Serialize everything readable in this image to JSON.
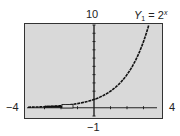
{
  "chart_data": {
    "type": "line",
    "function": "2^x",
    "series": [
      {
        "name": "Y1 = 2^x",
        "x": [
          -4,
          -3,
          -2,
          -1,
          0,
          1,
          2,
          3,
          3.32
        ],
        "values": [
          0.0625,
          0.125,
          0.25,
          0.5,
          1,
          2,
          4,
          8,
          10
        ]
      }
    ],
    "xlim": [
      -4,
      4
    ],
    "ylim": [
      -1,
      10
    ],
    "xscale": 1,
    "yscale": 1,
    "grid": false,
    "xlabel": "",
    "ylabel": "",
    "window_labels": {
      "xmin": "−4",
      "xmax": "4",
      "ymin": "−1",
      "ymax": "10"
    }
  },
  "labels": {
    "ymax": "10",
    "ymin": "−1",
    "xmin": "−4",
    "xmax": "4",
    "func_name": "Y",
    "func_sub": "1",
    "func_eq": " = 2",
    "func_sup": "x"
  },
  "colors": {
    "screen_bg": "#d9d9d9",
    "axis": "#222222",
    "curve": "#111111",
    "page_bg": "#ffffff"
  }
}
